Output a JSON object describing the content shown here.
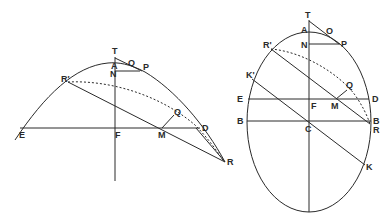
{
  "figures": [
    {
      "id": "parabola-like",
      "labels": {
        "T": "T",
        "A": "A",
        "N": "N",
        "O": "O",
        "P": "P",
        "R_prime": "R'",
        "Q": "Q",
        "E": "E",
        "F": "F",
        "M": "M",
        "D": "D",
        "R": "R"
      }
    },
    {
      "id": "ellipse",
      "labels": {
        "T": "T",
        "A": "A",
        "N": "N",
        "O": "O",
        "P": "P",
        "R_prime": "R'",
        "K_prime": "K'",
        "E": "E",
        "F": "F",
        "M": "M",
        "Q": "Q",
        "D": "D",
        "B_left": "B",
        "C": "C",
        "B_right": "B",
        "R": "R",
        "K": "K"
      }
    }
  ]
}
